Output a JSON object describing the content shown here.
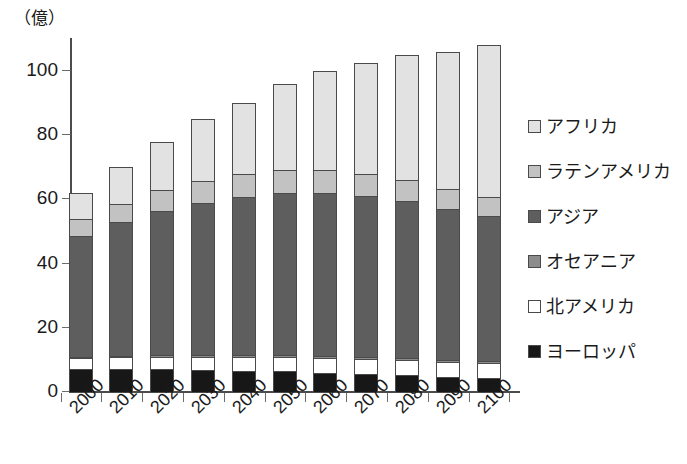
{
  "chart_data": {
    "type": "bar",
    "stacked": true,
    "title": "",
    "subtitle": "",
    "unit_label": "（億）",
    "xlabel": "",
    "ylabel": "",
    "ylim": [
      0,
      110
    ],
    "yticks": [
      0,
      20,
      40,
      60,
      80,
      100
    ],
    "ytick_labels": [
      "0",
      "20",
      "40",
      "60",
      "80",
      "100"
    ],
    "grid": false,
    "legend_position": "right",
    "categories": [
      "2000",
      "2010",
      "2020",
      "2030",
      "2040",
      "2050",
      "2060",
      "2070",
      "2080",
      "2090",
      "2100"
    ],
    "series": [
      {
        "name": "ヨーロッパ",
        "color": "#171717",
        "values": [
          7.3,
          7.3,
          7.2,
          7.0,
          6.7,
          6.4,
          6.0,
          5.6,
          5.2,
          4.7,
          4.3
        ]
      },
      {
        "name": "北アメリカ",
        "color": "#ffffff",
        "values": [
          3.2,
          3.5,
          3.8,
          4.0,
          4.2,
          4.4,
          4.5,
          4.6,
          4.7,
          4.7,
          4.7
        ]
      },
      {
        "name": "オセアニア",
        "color": "#8c8c8c",
        "values": [
          0.3,
          0.4,
          0.4,
          0.5,
          0.5,
          0.6,
          0.6,
          0.7,
          0.7,
          0.7,
          0.8
        ]
      },
      {
        "name": "アジア",
        "color": "#5e5e5e",
        "values": [
          37.9,
          41.7,
          45.1,
          47.5,
          49.5,
          50.7,
          50.9,
          50.2,
          48.8,
          47.0,
          45.0
        ]
      },
      {
        "name": "ラテンアメリカ",
        "color": "#c2c2c2",
        "values": [
          5.2,
          5.8,
          6.4,
          6.8,
          7.1,
          7.2,
          7.1,
          6.9,
          6.7,
          6.3,
          5.9
        ]
      },
      {
        "name": "アフリカ",
        "color": "#e2e2e2",
        "values": [
          8.1,
          11.3,
          15.1,
          19.2,
          22.0,
          26.7,
          30.9,
          34.6,
          38.9,
          42.6,
          47.3
        ]
      }
    ],
    "totals": [
      62.0,
      70.0,
      78.0,
      85.0,
      90.0,
      96.0,
      100.0,
      102.6,
      105.0,
      106.0,
      108.0
    ]
  },
  "legend": {
    "items": [
      {
        "label": "アフリカ",
        "swatch": "#e2e2e2"
      },
      {
        "label": "ラテンアメリカ",
        "swatch": "#c2c2c2"
      },
      {
        "label": "アジア",
        "swatch": "#5e5e5e"
      },
      {
        "label": "オセアニア",
        "swatch": "#8c8c8c"
      },
      {
        "label": "北アメリカ",
        "swatch": "#ffffff"
      },
      {
        "label": "ヨーロッパ",
        "swatch": "#171717"
      }
    ]
  },
  "colors": {
    "axis": "#4c4c4c",
    "text": "#1a1a1a",
    "bar_outline": "#4a4a4a",
    "background": "#ffffff"
  }
}
